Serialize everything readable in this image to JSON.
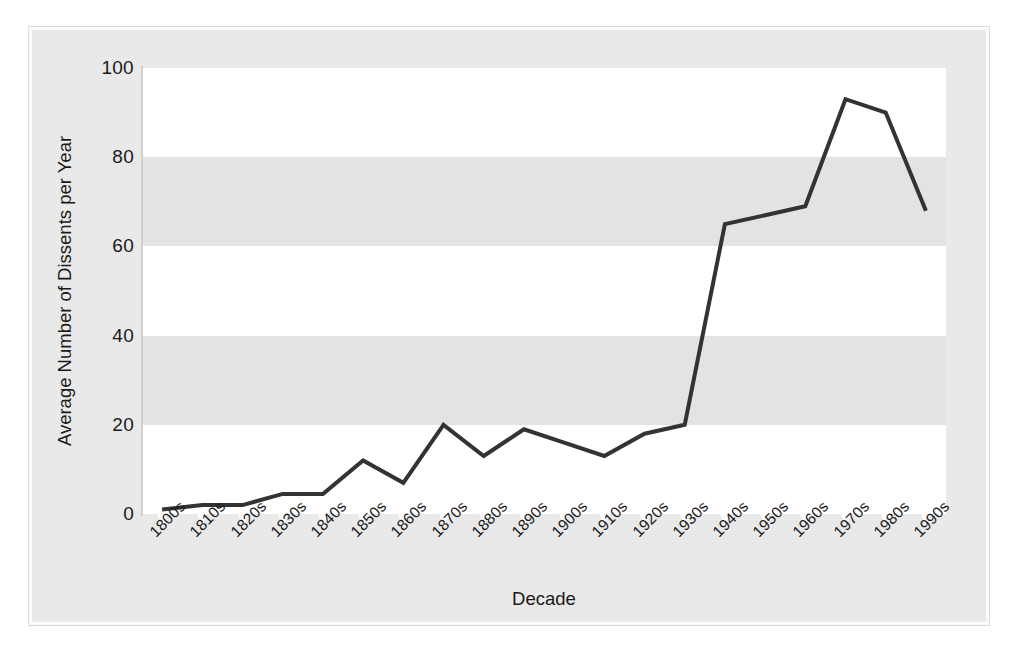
{
  "chart_data": {
    "type": "line",
    "title": "",
    "subtitle": "",
    "xlabel": "Decade",
    "ylabel": "Average Number of Dissents per Year",
    "categories": [
      "1800s",
      "1810s",
      "1820s",
      "1830s",
      "1840s",
      "1850s",
      "1860s",
      "1870s",
      "1880s",
      "1890s",
      "1900s",
      "1910s",
      "1920s",
      "1930s",
      "1940s",
      "1950s",
      "1960s",
      "1970s",
      "1980s",
      "1990s"
    ],
    "values": [
      1,
      2,
      2,
      4.5,
      4.5,
      12,
      7,
      20,
      13,
      19,
      16,
      13,
      18,
      20,
      65,
      67,
      69,
      93,
      90,
      68
    ],
    "series": [
      {
        "name": "Average Number of Dissents per Year",
        "values": [
          1,
          2,
          2,
          4.5,
          4.5,
          12,
          7,
          20,
          13,
          19,
          16,
          13,
          18,
          20,
          65,
          67,
          69,
          93,
          90,
          68
        ]
      }
    ],
    "ylim": [
      0,
      100
    ],
    "yticks": [
      0,
      20,
      40,
      60,
      80,
      100
    ],
    "ytick_labels": [
      "0",
      "20",
      "40",
      "60",
      "80",
      "100"
    ],
    "grid": false,
    "banded_background": true,
    "bands": [
      {
        "from": 0,
        "to": 20,
        "shade": "light"
      },
      {
        "from": 20,
        "to": 40,
        "shade": "dark"
      },
      {
        "from": 40,
        "to": 60,
        "shade": "light"
      },
      {
        "from": 60,
        "to": 80,
        "shade": "dark"
      },
      {
        "from": 80,
        "to": 100,
        "shade": "light"
      }
    ],
    "legend": null,
    "legend_position": "none",
    "annotations": [],
    "line_color": "#333333",
    "line_width": 4,
    "markers": false
  },
  "colors": {
    "line": "#333333",
    "panel": "#e9e9e9",
    "band_light": "#ffffff",
    "band_dark": "#e3e3e3",
    "text": "#1a1a1a",
    "frame": "#dcdcdc",
    "tick_marker": "#fdfdfd"
  }
}
